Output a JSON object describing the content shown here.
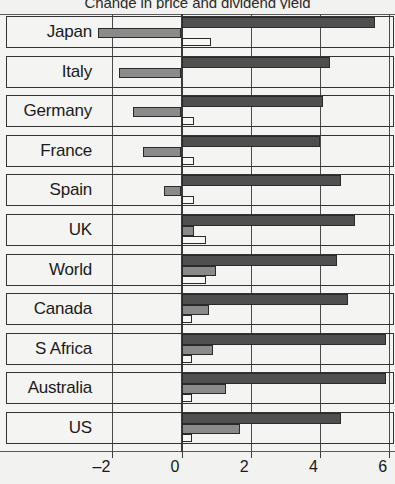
{
  "chart_data": {
    "type": "bar",
    "orientation": "horizontal",
    "title": "Change in price and dividend yield",
    "xlabel": "",
    "ylabel": "",
    "xlim": [
      -2.75,
      6.2
    ],
    "xticks": [
      -2,
      0,
      2,
      4,
      6
    ],
    "xtick_labels": [
      "–2",
      "0",
      "2",
      "4",
      "6"
    ],
    "grid": true,
    "legend": "none",
    "categories": [
      "Japan",
      "Italy",
      "Germany",
      "France",
      "Spain",
      "UK",
      "World",
      "Canada",
      "S Africa",
      "Australia",
      "US"
    ],
    "series": [
      {
        "name": "Dividend yield",
        "color": "#4f4f4f",
        "values": [
          5.6,
          4.3,
          4.1,
          4.0,
          4.6,
          5.0,
          4.5,
          4.8,
          5.9,
          5.9,
          4.6
        ]
      },
      {
        "name": "Price change",
        "color": "#8a8a8a",
        "values": [
          -2.4,
          -1.8,
          -1.4,
          -1.1,
          -0.5,
          0.35,
          1.0,
          0.8,
          0.9,
          1.3,
          1.7
        ]
      },
      {
        "name": "Net change",
        "color": "#f7f7f5",
        "values": [
          0.85,
          0.0,
          0.35,
          0.35,
          0.35,
          0.7,
          0.7,
          0.3,
          0.3,
          0.3,
          0.3
        ]
      }
    ]
  },
  "axis": {
    "tick_labels": [
      "–2",
      "0",
      "2",
      "4",
      "6"
    ]
  },
  "labels": {
    "japan": "Japan",
    "italy": "Italy",
    "germany": "Germany",
    "france": "France",
    "spain": "Spain",
    "uk": "UK",
    "world": "World",
    "canada": "Canada",
    "s_africa": "S Africa",
    "australia": "Australia",
    "us": "US"
  },
  "colors": {
    "series_dark": "#4f4f4f",
    "series_mid": "#8a8a8a",
    "series_light": "#f7f7f5",
    "grid": "#4a4a4a",
    "background": "#f2f2f0",
    "text": "#1a1a1a"
  }
}
